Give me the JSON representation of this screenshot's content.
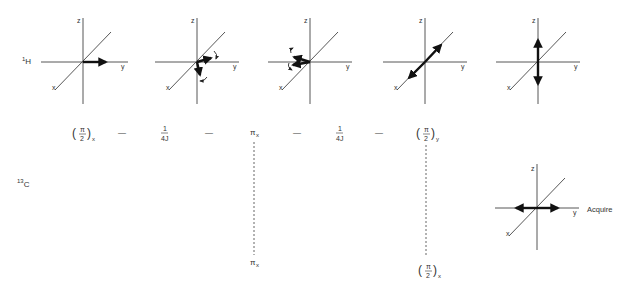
{
  "nuclei": {
    "proton": {
      "base": "1",
      "symbol": "H"
    },
    "carbon": {
      "base": "13",
      "symbol": "C"
    }
  },
  "axes": {
    "x": "x",
    "y": "y",
    "z": "z"
  },
  "proton_frames": [
    {
      "id": "frame1",
      "description": "magnetization along +y"
    },
    {
      "id": "frame2",
      "description": "vectors dephasing in xy-plane"
    },
    {
      "id": "frame3",
      "description": "vectors refocusing after pi pulse"
    },
    {
      "id": "frame4",
      "description": "antiphase along x axis"
    },
    {
      "id": "frame5",
      "description": "antiphase along z axis"
    }
  ],
  "proton_sequence": [
    {
      "type": "pulse",
      "num": "π",
      "den": "2",
      "sub": "x"
    },
    {
      "type": "dash",
      "text": "—"
    },
    {
      "type": "delay",
      "num": "1",
      "den": "4J"
    },
    {
      "type": "dash",
      "text": "—"
    },
    {
      "type": "pi",
      "text": "π",
      "sub": "x"
    },
    {
      "type": "dash",
      "text": "—"
    },
    {
      "type": "delay",
      "num": "1",
      "den": "4J"
    },
    {
      "type": "dash",
      "text": "—"
    },
    {
      "type": "pulse",
      "num": "π",
      "den": "2",
      "sub": "y"
    }
  ],
  "carbon_sequence": [
    {
      "type": "pi",
      "text": "π",
      "sub": "x"
    },
    {
      "type": "pulse",
      "num": "π",
      "den": "2",
      "sub": "x"
    }
  ],
  "carbon_frame": {
    "label": "Acquire",
    "description": "antiphase along y axis"
  }
}
